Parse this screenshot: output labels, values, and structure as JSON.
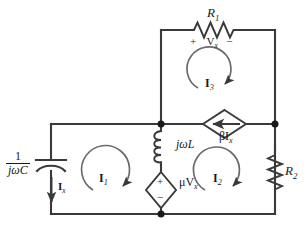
{
  "figure": {
    "kind": "circuit-schematic",
    "background_color": "#ffffff",
    "wire_color": "#3a3a3a",
    "text_color": "#1a1a1a"
  },
  "components": {
    "capacitor": {
      "name": "capacitor",
      "label_numerator": "1",
      "label_denominator": "jωC",
      "orientation": "vertical",
      "position": "left-branch"
    },
    "inductor": {
      "name": "inductor",
      "label": "jωL",
      "orientation": "vertical",
      "position": "middle-branch-upper"
    },
    "resistor_top": {
      "name": "resistor-r1",
      "label_base": "R",
      "label_sub": "1",
      "orientation": "horizontal",
      "position": "top-branch",
      "voltage_plus": "+",
      "voltage_label_base": "V",
      "voltage_label_sub": "x",
      "voltage_minus": "−"
    },
    "resistor_right": {
      "name": "resistor-r2",
      "label_base": "R",
      "label_sub": "2",
      "orientation": "vertical",
      "position": "right-branch"
    },
    "dependent_current_source": {
      "name": "dependent-current-source",
      "symbol": "diamond-with-arrow",
      "arrow_direction": "left",
      "label_coeff": "β",
      "label_base": "I",
      "label_sub": "x",
      "position": "middle-right-branch"
    },
    "dependent_voltage_source": {
      "name": "dependent-voltage-source",
      "symbol": "diamond-with-polarity",
      "polarity_top": "+",
      "polarity_bottom": "−",
      "label_coeff": "μ",
      "label_base": "V",
      "label_sub": "x",
      "position": "middle-branch-lower"
    }
  },
  "currents": {
    "branch_current": {
      "name": "current-ix",
      "label_base": "I",
      "label_sub": "x",
      "direction": "down",
      "position": "left-branch-below-capacitor"
    },
    "meshes": [
      {
        "name": "mesh-current-i1",
        "label_base": "I",
        "label_sub": "1",
        "direction": "clockwise",
        "position": "lower-left-loop"
      },
      {
        "name": "mesh-current-i2",
        "label_base": "I",
        "label_sub": "2",
        "direction": "clockwise",
        "position": "lower-right-loop"
      },
      {
        "name": "mesh-current-i3",
        "label_base": "I",
        "label_sub": "3",
        "direction": "clockwise",
        "position": "upper-loop"
      }
    ]
  },
  "nodes": [
    {
      "name": "node-middle-top",
      "x": 161,
      "y": 124
    },
    {
      "name": "node-right",
      "x": 275,
      "y": 124
    },
    {
      "name": "node-bottom-middle",
      "x": 161,
      "y": 214
    }
  ]
}
